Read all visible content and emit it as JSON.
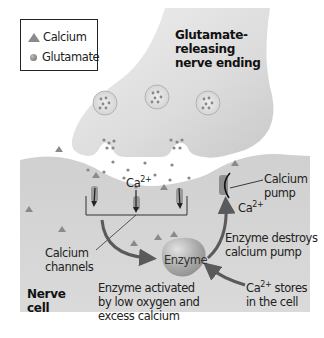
{
  "legend": {
    "items": [
      {
        "icon": "triangle-icon",
        "label": "Calcium"
      },
      {
        "icon": "circle-icon",
        "label": "Glutamate"
      }
    ]
  },
  "labels": {
    "nerve_ending": [
      "Glutamate-",
      "releasing",
      "nerve ending"
    ],
    "ca_ion": "Ca",
    "ca_charge": "2+",
    "calcium_pump": [
      "Calcium",
      "pump"
    ],
    "pump_ca": "Ca",
    "pump_ca_charge": "2+",
    "calcium_channels": [
      "Calcium",
      "channels"
    ],
    "enzyme": "Enzyme",
    "enzyme_destroys": [
      "Enzyme destroys",
      "calcium pump"
    ],
    "enzyme_activated": [
      "Enzyme activated",
      "by low oxygen and",
      "excess calcium"
    ],
    "ca_stores_ca": "Ca",
    "ca_stores_charge": "2+",
    "ca_stores": [
      " stores",
      "in the cell"
    ],
    "nerve_cell": [
      "Nerve",
      "cell"
    ]
  },
  "colors": {
    "membrane": "#d4d4d4",
    "background": "#ffffff",
    "enzyme": "#a9a9a9",
    "arrow": "#5a5a5a"
  }
}
